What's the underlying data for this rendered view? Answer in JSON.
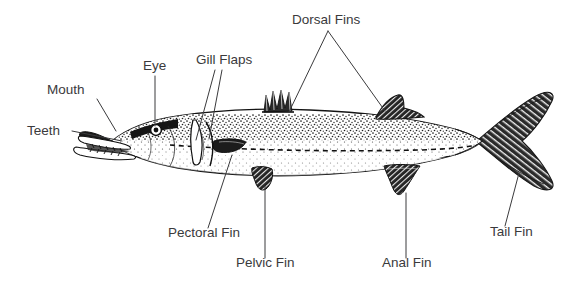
{
  "diagram": {
    "background_color": "#ffffff",
    "label_color": "#3a3a3c",
    "line_color": "#3a3a3c",
    "illustration_ink": "#1b1b1b",
    "labels": [
      {
        "id": "mouth",
        "text": "Mouth",
        "x": 47,
        "y": 94,
        "anchor": "start"
      },
      {
        "id": "teeth",
        "text": "Teeth",
        "x": 27,
        "y": 135,
        "anchor": "start"
      },
      {
        "id": "eye",
        "text": "Eye",
        "x": 143,
        "y": 70,
        "anchor": "start"
      },
      {
        "id": "gill-flaps",
        "text": "Gill Flaps",
        "x": 196,
        "y": 64,
        "anchor": "start"
      },
      {
        "id": "dorsal-fins",
        "text": "Dorsal Fins",
        "x": 292,
        "y": 24,
        "anchor": "start"
      },
      {
        "id": "pectoral-fin",
        "text": "Pectoral Fin",
        "x": 168,
        "y": 237,
        "anchor": "start"
      },
      {
        "id": "pelvic-fin",
        "text": "Pelvic Fin",
        "x": 236,
        "y": 267,
        "anchor": "start"
      },
      {
        "id": "anal-fin",
        "text": "Anal Fin",
        "x": 382,
        "y": 267,
        "anchor": "start"
      },
      {
        "id": "tail-fin",
        "text": "Tail Fin",
        "x": 490,
        "y": 236,
        "anchor": "start"
      }
    ],
    "leader_lines": [
      {
        "id": "mouth",
        "points": "97,99 116,131"
      },
      {
        "id": "teeth",
        "points": "72,131 122,141"
      },
      {
        "id": "eye",
        "points": "155,76 155,126"
      },
      {
        "id": "gill-flaps-a",
        "points": "215,70 196,140"
      },
      {
        "id": "gill-flaps-b",
        "points": "222,70 209,139"
      },
      {
        "id": "dorsal-fins-a",
        "points": "328,31 289,112"
      },
      {
        "id": "dorsal-fins-b",
        "points": "328,31 385,111"
      },
      {
        "id": "pectoral-fin",
        "points": "208,228 232,155"
      },
      {
        "id": "pelvic-fin",
        "points": "265,258 265,186"
      },
      {
        "id": "anal-fin",
        "points": "406,258 406,193"
      },
      {
        "id": "tail-fin",
        "points": "505,226 519,173"
      }
    ]
  }
}
